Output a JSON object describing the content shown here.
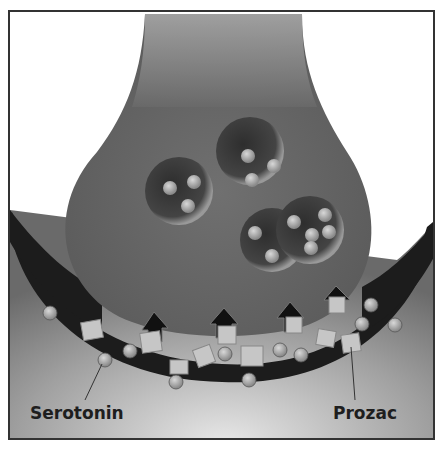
{
  "figure": {
    "labels": {
      "serotonin": "Serotonin",
      "prozac": "Prozac"
    },
    "colors": {
      "frame": "#333333",
      "neuron": "#6e6e6e",
      "cleft": "#1c1c1c",
      "molecule": "#a8a8a8",
      "background": "#ffffff"
    }
  }
}
